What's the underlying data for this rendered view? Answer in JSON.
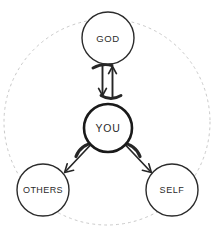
{
  "diagram": {
    "type": "relationship-diagram",
    "colors": {
      "background": "#ffffff",
      "node_stroke": "#2b2b2b",
      "emphasis_stroke": "#1a1a1a",
      "arrow": "#262626",
      "dashed_boundary": "#c9c9c9",
      "label_text": "#2b2b2b"
    },
    "boundary": {
      "shape": "circle",
      "style": "dashed",
      "center_x": 107,
      "center_y": 122,
      "radius": 103,
      "stroke_width": 1,
      "dash_pattern": "2 4"
    },
    "nodes": [
      {
        "id": "god",
        "label": "GOD",
        "center_x": 108,
        "center_y": 38,
        "radius": 26,
        "stroke_width": 1.4,
        "emphasis": false
      },
      {
        "id": "you",
        "label": "YOU",
        "center_x": 108,
        "center_y": 128,
        "radius": 24,
        "stroke_width": 2.6,
        "emphasis": true
      },
      {
        "id": "others",
        "label": "OTHERS",
        "center_x": 43,
        "center_y": 190,
        "radius": 26,
        "stroke_width": 1.4,
        "emphasis": false
      },
      {
        "id": "self",
        "label": "SELF",
        "center_x": 172,
        "center_y": 190,
        "radius": 26,
        "stroke_width": 1.4,
        "emphasis": false
      }
    ],
    "connectors": [
      {
        "id": "god-to-you",
        "from": "god",
        "to": "you",
        "direction": "down",
        "style": "calligraphic-arrow"
      },
      {
        "id": "you-to-god",
        "from": "you",
        "to": "god",
        "direction": "up",
        "style": "calligraphic-arrow"
      },
      {
        "id": "you-to-others",
        "from": "you",
        "to": "others",
        "direction": "down-left",
        "style": "hooked-arrow"
      },
      {
        "id": "you-to-self",
        "from": "you",
        "to": "self",
        "direction": "down-right",
        "style": "hooked-arrow"
      }
    ]
  }
}
